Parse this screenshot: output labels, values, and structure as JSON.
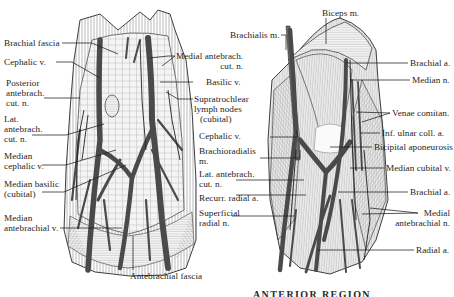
{
  "figure": {
    "type": "anatomical illustration",
    "panels": [
      {
        "id": "left",
        "description": "Superficial veins and nerves of the anterior elbow (cubital fossa), skin removed",
        "labels": {
          "brachial_fascia": "Brachial fascia",
          "cephalic_v": "Cephalic v.",
          "posterior_antebrach_cut_n": [
            "Posterior",
            "antebrach.",
            "cut. n."
          ],
          "lat_antebrach_cut_n": [
            "Lat.",
            "antebrach.",
            "cut. n."
          ],
          "median_cephalic_v": [
            "Median",
            "cephalic v."
          ],
          "median_basilic": [
            "Median basilic",
            "(cubital)"
          ],
          "median_antebrachial_v": [
            "Median",
            "antebrachial v."
          ],
          "antebrachial_fascia": "Antebrachial fascia",
          "medial_antebrach_cut_n": [
            "Medial antebrach.",
            "cut. n."
          ],
          "basilic_v": "Basilic v.",
          "supratrochlear_lymph_nodes": [
            "Supratrochlear",
            "lymph nodes",
            "(cubital)"
          ]
        }
      },
      {
        "id": "right",
        "description": "Deeper dissection of the cubital fossa showing muscles, arteries and nerves",
        "labels": {
          "biceps_m": "Biceps m.",
          "brachialis_m": "Brachialis m.",
          "cephalic_v": "Cephalic v.",
          "brachioradialis_m": [
            "Brachioradialis",
            "m."
          ],
          "lat_antebrach_cut_n": [
            "Lat. antebrach.",
            "cut. n."
          ],
          "recurr_radial_a": "Recurr. radial a.",
          "superficial_radial_n": [
            "Superficial",
            "radial n."
          ],
          "brachial_a_top": "Brachial a.",
          "median_n": "Median n.",
          "venae_comitan": "Venae comitan.",
          "inf_ulnar_coll_a": "Inf. ulnar coll. a.",
          "bicipital_aponeurosis": "Bicipital aponeurosis",
          "median_cubital_v": "Median cubital v.",
          "brachial_a_bottom": "Brachial a.",
          "medial_antebrachial_n": [
            "Medial",
            "antebrachial n."
          ],
          "radial_a": "Radial a."
        }
      }
    ],
    "caption_partial": "ANTERIOR REGION"
  },
  "colors": {
    "ink": "#1e1e1e",
    "vessel": "#4a4a4a",
    "tissue": "#f2f2f2",
    "hatch": "#9a9a9a",
    "background": "#ffffff"
  }
}
